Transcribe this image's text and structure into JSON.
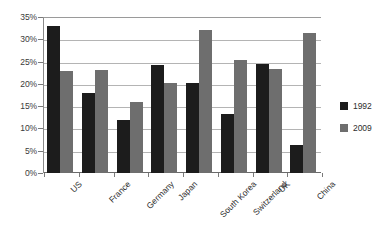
{
  "chart_data": {
    "type": "bar",
    "title": "",
    "subtitle": "",
    "xlabel": "",
    "ylabel": "",
    "ylim": [
      0,
      35
    ],
    "ytick_labels": [
      "0%",
      "5%",
      "10%",
      "15%",
      "20%",
      "25%",
      "30%",
      "35%"
    ],
    "ytick_values": [
      0,
      5,
      10,
      15,
      20,
      25,
      30,
      35
    ],
    "grid": true,
    "legend_position": "right",
    "categories": [
      "US",
      "France",
      "Germany",
      "Japan",
      "South Korea",
      "Switzerland",
      "UK",
      "China"
    ],
    "series": [
      {
        "name": "1992",
        "color": "#1c1c1c",
        "values": [
          33.0,
          18.0,
          12.0,
          24.3,
          20.2,
          13.3,
          24.4,
          6.3
        ]
      },
      {
        "name": "2009",
        "color": "#6e6e6e",
        "values": [
          23.0,
          23.1,
          16.0,
          20.2,
          32.1,
          25.3,
          23.4,
          31.5
        ]
      }
    ]
  }
}
